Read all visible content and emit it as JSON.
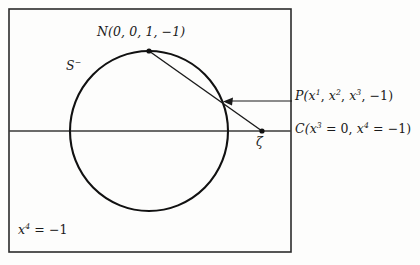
{
  "figure": {
    "name": "stereographic-projection-diagram",
    "colors": {
      "ink": "#1a1a1a",
      "background": "#fdfdfc",
      "frame": "#2b2b2b",
      "curve": "#111111"
    }
  },
  "labels": {
    "north_pole": {
      "symbol": "N",
      "open_paren": "(",
      "coords": "0, 0, 1, −1",
      "close_paren": ")",
      "full": "N(0, 0, 1, −1)"
    },
    "sphere": {
      "symbol": "S",
      "superscript": "−",
      "full": "S⁻"
    },
    "point_P": {
      "symbol": "P",
      "full": "P(x¹, x², x³, −1)",
      "parts": {
        "open": "P(",
        "x1_base": "x",
        "x1_sup": "1",
        "sep1": ", ",
        "x2_base": "x",
        "x2_sup": "2",
        "sep2": ", ",
        "x3_base": "x",
        "x3_sup": "3",
        "sep3": ", ",
        "minus_one": "−1",
        "close": ")"
      }
    },
    "point_C": {
      "symbol": "C",
      "full": "C(x³ = 0, x⁴ = −1)",
      "parts": {
        "open": "C(",
        "x3_base": "x",
        "x3_sup": "3",
        "eq1": " = 0, ",
        "x4_base": "x",
        "x4_sup": "4",
        "eq2": " = −1",
        "close": ")"
      }
    },
    "zeta": {
      "symbol": "ζ",
      "full": "ζ"
    },
    "hyperplane": {
      "full": "x⁴ = −1",
      "parts": {
        "x_base": "x",
        "x_sup": "4",
        "equals": " = −1"
      }
    }
  },
  "geometry": {
    "frame": {
      "x": 9,
      "y": 9,
      "width": 282,
      "height": 243
    },
    "circle": {
      "cx": 149,
      "cy": 131,
      "r": 80
    },
    "horizontal_line": {
      "x1": 9,
      "y1": 131,
      "x2": 291,
      "y2": 131
    },
    "points": {
      "N": {
        "x": 149,
        "y": 51
      },
      "P": {
        "x": 224,
        "y": 102
      },
      "zeta": {
        "x": 262,
        "y": 131
      }
    },
    "ray": {
      "from": "N",
      "through": "P",
      "to": "zeta"
    },
    "pointer_arrow": {
      "tail_x": 292,
      "tail_y": 101,
      "head_x": 228,
      "head_y": 101
    }
  }
}
